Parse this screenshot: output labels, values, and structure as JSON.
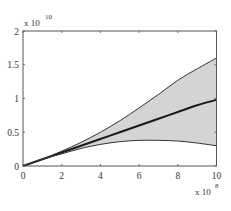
{
  "chart_data": {
    "type": "area",
    "title": "",
    "xlabel": "",
    "ylabel": "",
    "x_multiplier": "x 10^8",
    "y_multiplier": "x 10^10",
    "x_exponent_base": "x 10",
    "x_exponent_power": "8",
    "y_exponent_base": "x 10",
    "y_exponent_power": "10",
    "xlim": [
      0,
      10
    ],
    "ylim": [
      0,
      2
    ],
    "x_ticks": [
      "0",
      "2",
      "4",
      "6",
      "8",
      "10"
    ],
    "y_ticks": [
      "0",
      "0.5",
      "1",
      "1.5",
      "2"
    ],
    "grid": false,
    "legend": null,
    "x": [
      0,
      1,
      2,
      3,
      4,
      5,
      6,
      7,
      8,
      9,
      10
    ],
    "series": [
      {
        "name": "mean",
        "style": "thick-line",
        "color": "#1a1a1a",
        "values": [
          0,
          0.1,
          0.2,
          0.3,
          0.4,
          0.5,
          0.6,
          0.7,
          0.8,
          0.9,
          0.98
        ]
      },
      {
        "name": "upper bound",
        "style": "thin-line",
        "color": "#333333",
        "values": [
          0,
          0.1,
          0.22,
          0.35,
          0.5,
          0.67,
          0.86,
          1.06,
          1.27,
          1.44,
          1.6
        ]
      },
      {
        "name": "lower bound",
        "style": "thin-line",
        "color": "#333333",
        "values": [
          0,
          0.1,
          0.18,
          0.26,
          0.32,
          0.36,
          0.38,
          0.38,
          0.37,
          0.34,
          0.3
        ]
      }
    ],
    "band": {
      "between": [
        "lower bound",
        "upper bound"
      ],
      "fill": "#d4d4d4"
    }
  }
}
